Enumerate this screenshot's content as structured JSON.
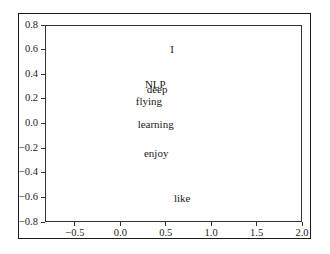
{
  "chart_data": {
    "type": "scatter",
    "title": "",
    "xlabel": "",
    "ylabel": "",
    "xlim": [
      -0.83,
      2.0
    ],
    "ylim": [
      -0.8,
      0.8
    ],
    "grid": false,
    "legend": null,
    "markers_visible": false,
    "annotation_style": "text labels placed at data coordinates",
    "xticks": [
      -0.5,
      0.0,
      0.5,
      1.0,
      1.5,
      2.0
    ],
    "xtick_labels": [
      "−0.5",
      "0.0",
      "0.5",
      "1.0",
      "1.5",
      "2.0"
    ],
    "yticks": [
      0.8,
      0.6,
      0.4,
      0.2,
      0.0,
      -0.2,
      -0.4,
      -0.6,
      -0.8
    ],
    "ytick_labels": [
      "0.8",
      "0.6",
      "0.4",
      "0.2",
      "0.0",
      "−0.2",
      "−0.4",
      "−0.6",
      "−0.8"
    ],
    "points": [
      {
        "label": "I",
        "x": 0.55,
        "y": 0.57
      },
      {
        "label": "NLP",
        "x": 0.27,
        "y": 0.29
      },
      {
        "label": "deep",
        "x": 0.29,
        "y": 0.25
      },
      {
        "label": "flying",
        "x": 0.17,
        "y": 0.15
      },
      {
        "label": "learning",
        "x": 0.19,
        "y": -0.04
      },
      {
        "label": "enjoy",
        "x": 0.26,
        "y": -0.27
      },
      {
        "label": "like",
        "x": 0.59,
        "y": -0.64
      }
    ],
    "x": [
      0.55,
      0.27,
      0.29,
      0.17,
      0.19,
      0.26,
      0.59
    ],
    "y": [
      0.57,
      0.29,
      0.25,
      0.15,
      -0.04,
      -0.27,
      -0.64
    ],
    "categories": [
      "I",
      "NLP",
      "deep",
      "flying",
      "learning",
      "enjoy",
      "like"
    ]
  },
  "colors": {
    "text": "#222222",
    "axis": "#333333",
    "frame": "#1a1a1a",
    "background": "#ffffff"
  }
}
